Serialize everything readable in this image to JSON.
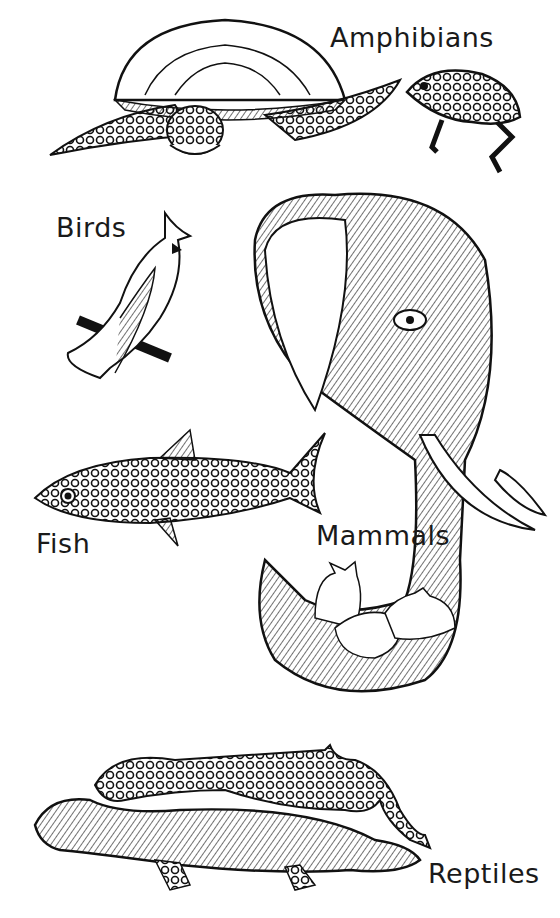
{
  "labels": {
    "amphibians": "Amphibians",
    "birds": "Birds",
    "fish": "Fish",
    "mammals": "Mammals",
    "reptiles": "Reptiles"
  },
  "colors": {
    "ink": "#111111",
    "paper": "#ffffff"
  }
}
